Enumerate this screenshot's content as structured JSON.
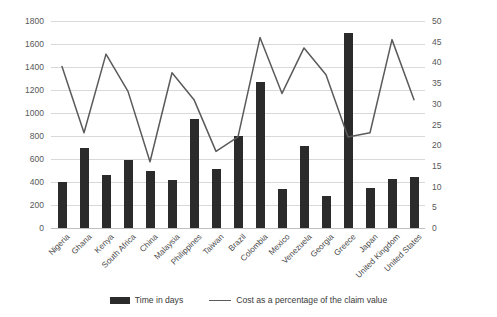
{
  "chart_data": {
    "type": "bar",
    "title": "",
    "xlabel": "",
    "ylabel": "",
    "grid": true,
    "legend_position": "bottom",
    "categories": [
      "Nigeria",
      "Ghana",
      "Kenya",
      "South Africa",
      "China",
      "Malaysia",
      "Philippines",
      "Taiwan",
      "Brazil",
      "Colombia",
      "Mexico",
      "Venezuela",
      "Georgia",
      "Greece",
      "Japan",
      "United Kingdom",
      "United States"
    ],
    "series": [
      {
        "name": "Time in days",
        "type": "bar",
        "axis": "left",
        "color": "#2b2b2b",
        "values": [
          400,
          700,
          460,
          590,
          500,
          420,
          950,
          510,
          800,
          1270,
          340,
          710,
          280,
          1700,
          350,
          430,
          440
        ]
      },
      {
        "name": "Cost as a percentage of the claim value",
        "type": "line",
        "axis": "right",
        "color": "#5a5a5a",
        "values": [
          39,
          23,
          42,
          33,
          16,
          37.5,
          31,
          18.5,
          22,
          46,
          32.5,
          43.5,
          37,
          22,
          23,
          45.5,
          31
        ]
      }
    ],
    "y_left": {
      "label": "",
      "min": 0,
      "max": 1800,
      "step": 200,
      "ticks": [
        "0",
        "200",
        "400",
        "600",
        "800",
        "1000",
        "1200",
        "1400",
        "1600",
        "1800"
      ]
    },
    "y_right": {
      "label": "",
      "min": 0,
      "max": 50,
      "step": 5,
      "ticks": [
        "0",
        "5",
        "10",
        "15",
        "20",
        "25",
        "30",
        "35",
        "40",
        "45",
        "50"
      ]
    },
    "legend": [
      {
        "label": "Time in days",
        "marker": "bar-swatch"
      },
      {
        "label": "Cost as a percentage of the claim value",
        "marker": "line-swatch"
      }
    ]
  }
}
